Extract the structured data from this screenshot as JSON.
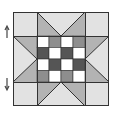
{
  "diagram": {
    "kind": "quilt-block",
    "colors": {
      "light": "#e2e2e2",
      "medium": "#b3b3b3",
      "check_medium": "#8e8e8e",
      "check_dark": "#555555",
      "white": "#ffffff",
      "line": "#333333",
      "arrow": "#444444"
    },
    "checkerboard": {
      "rows": 4,
      "cols": 4,
      "cells": [
        [
          "white",
          "check_medium",
          "white",
          "check_medium"
        ],
        [
          "check_dark",
          "white",
          "check_dark",
          "white"
        ],
        [
          "white",
          "check_dark",
          "white",
          "check_dark"
        ],
        [
          "check_medium",
          "white",
          "check_medium",
          "white"
        ]
      ]
    },
    "arrows": [
      {
        "direction": "up",
        "label": "up-arrow"
      },
      {
        "direction": "down",
        "label": "down-arrow"
      }
    ]
  }
}
